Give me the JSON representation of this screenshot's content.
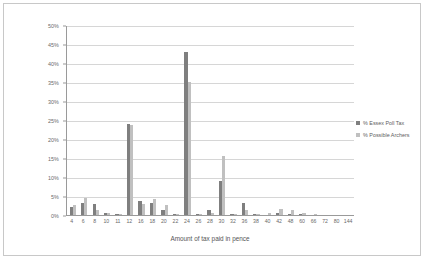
{
  "chart_data": {
    "type": "bar",
    "title": "",
    "xlabel": "Amount of tax paid in pence",
    "ylabel": "",
    "ylim": [
      0,
      50
    ],
    "ytick_labels": [
      "0%",
      "5%",
      "10%",
      "15%",
      "20%",
      "25%",
      "30%",
      "35%",
      "40%",
      "45%",
      "50%"
    ],
    "ytick_values": [
      0,
      5,
      10,
      15,
      20,
      25,
      30,
      35,
      40,
      45,
      50
    ],
    "grid": true,
    "legend_position": "right",
    "categories": [
      "4",
      "6",
      "8",
      "10",
      "11",
      "12",
      "16",
      "18",
      "20",
      "22",
      "24",
      "26",
      "28",
      "30",
      "32",
      "36",
      "38",
      "40",
      "42",
      "48",
      "60",
      "66",
      "72",
      "80",
      "144"
    ],
    "series": [
      {
        "name": "% Essex Poll Tax",
        "color": "#7f7f7f",
        "values": [
          2.0,
          3.2,
          3.0,
          0.6,
          0.2,
          24.0,
          3.6,
          3.2,
          1.4,
          0.3,
          43.0,
          0.2,
          1.2,
          9.0,
          0.2,
          3.2,
          0.2,
          0.0,
          0.6,
          0.2,
          0.3,
          0.0,
          0.0,
          0.0,
          0.0
        ]
      },
      {
        "name": "% Possible Archers",
        "color": "#c0c0c0",
        "values": [
          2.6,
          4.6,
          1.2,
          0.4,
          0.1,
          23.6,
          3.0,
          4.2,
          2.6,
          0.2,
          35.0,
          0.1,
          0.6,
          15.5,
          0.1,
          1.2,
          0.2,
          0.4,
          1.6,
          1.2,
          0.6,
          0.1,
          0.0,
          0.0,
          0.0
        ]
      }
    ]
  }
}
